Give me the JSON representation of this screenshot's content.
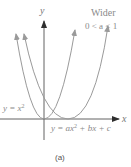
{
  "figure": {
    "caption": "(a)",
    "axes": {
      "x_label": "x",
      "y_label": "y"
    },
    "curves": [
      {
        "name": "standard-parabola",
        "label_prefix": "y = x",
        "label_exp": "2",
        "color": "#9a9a9a"
      },
      {
        "name": "wider-parabola",
        "label_prefix": "y = ax",
        "label_exp": "2",
        "label_suffix": " + bx + c",
        "color": "#9a9a9a"
      }
    ],
    "annotation": {
      "title": "Wider",
      "condition": "0 < a < 1"
    }
  },
  "colors": {
    "axis": "#3a3a3a",
    "curve": "#9a9a9a",
    "label": "#8a8a8a"
  }
}
